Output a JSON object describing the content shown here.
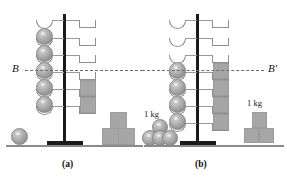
{
  "figure": {
    "type": "physics-diagram",
    "reference_lines": [
      {
        "name": "B",
        "label": "B",
        "panel": "a",
        "side": "left",
        "y": 69
      },
      {
        "name": "B'",
        "label": "B′",
        "panel": "b",
        "side": "right",
        "y": 69
      }
    ],
    "panels": [
      {
        "id": "a",
        "label": "(a)",
        "shelf_count": 6,
        "left_arm_items": [
          "empty",
          "sphere",
          "sphere",
          "sphere",
          "sphere",
          "sphere"
        ],
        "right_arm_items": [
          "empty",
          "empty",
          "empty",
          "empty",
          "cube",
          "cube"
        ],
        "floor_left": {
          "kind": "sphere",
          "count": 1,
          "mass_label": ""
        },
        "floor_right": {
          "kind": "cube-stack",
          "bottom_count": 2,
          "top_count": 1,
          "mass_label": ""
        }
      },
      {
        "id": "b",
        "label": "(b)",
        "shelf_count": 7,
        "left_arm_items": [
          "empty",
          "empty",
          "empty",
          "sphere",
          "sphere",
          "sphere",
          "sphere"
        ],
        "right_arm_items": [
          "empty",
          "empty",
          "empty",
          "cube",
          "cube",
          "cube",
          "cube"
        ],
        "floor_left": {
          "kind": "sphere-pile",
          "bottom_count": 3,
          "top_count": 1,
          "mass_label": "1 kg"
        },
        "floor_right": {
          "kind": "cube-stack",
          "bottom_count": 2,
          "top_count": 1,
          "mass_label": "1 kg"
        }
      }
    ],
    "mass_labels": [
      "1 kg",
      "1 kg"
    ],
    "colors": {
      "background": "#ffffff",
      "rod": "#1b1b1b",
      "ground": "#8a8a8a",
      "shelf_outline": "#8f8f8f",
      "sphere_fill": "#b3b3b3",
      "cube_fill": "#a6a6a6",
      "dash_line": "#6e6e6e",
      "text": "#111111"
    }
  }
}
